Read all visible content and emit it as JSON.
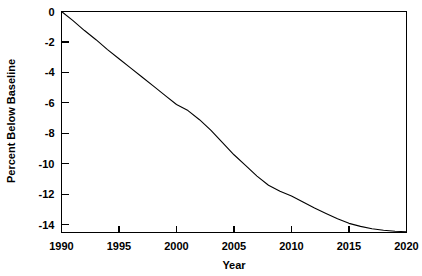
{
  "chart_data": {
    "type": "line",
    "title": "",
    "xlabel": "Year",
    "ylabel": "Percent Below Baseline",
    "xlim": [
      1990,
      2020
    ],
    "ylim": [
      -14.5,
      0
    ],
    "grid": false,
    "legend": null,
    "xticks": [
      1990,
      1995,
      2000,
      2005,
      2010,
      2015,
      2020
    ],
    "xtick_labels": [
      "1990",
      "1995",
      "2000",
      "2005",
      "2010",
      "2015",
      "2020"
    ],
    "yticks": [
      0,
      -2,
      -4,
      -6,
      -8,
      -10,
      -12,
      -14
    ],
    "ytick_labels": [
      "0",
      "-2",
      "-4",
      "-6",
      "-8",
      "-10",
      "-12",
      "-14"
    ],
    "series": [
      {
        "name": "Percent Below Baseline",
        "color": "#000000",
        "x": [
          1990,
          1991,
          1992,
          1993,
          1994,
          1995,
          1996,
          1997,
          1998,
          1999,
          2000,
          2001,
          2002,
          2003,
          2004,
          2005,
          2006,
          2007,
          2008,
          2009,
          2010,
          2011,
          2012,
          2013,
          2014,
          2015,
          2016,
          2017,
          2018,
          2019,
          2020
        ],
        "y": [
          0.0,
          -0.6,
          -1.25,
          -1.85,
          -2.5,
          -3.1,
          -3.7,
          -4.3,
          -4.9,
          -5.5,
          -6.1,
          -6.5,
          -7.1,
          -7.8,
          -8.6,
          -9.4,
          -10.1,
          -10.8,
          -11.4,
          -11.8,
          -12.1,
          -12.5,
          -12.9,
          -13.25,
          -13.6,
          -13.9,
          -14.1,
          -14.25,
          -14.35,
          -14.42,
          -14.45
        ]
      }
    ]
  }
}
